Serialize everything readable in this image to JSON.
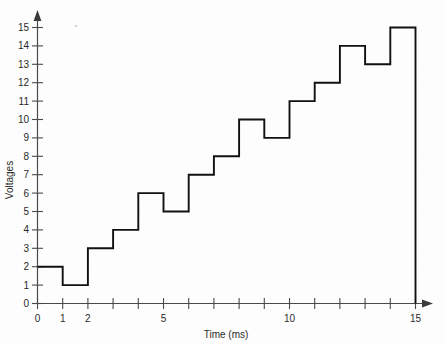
{
  "chart_data": {
    "type": "line",
    "subtype": "step-post",
    "title": "",
    "xlabel": "Time (ms)",
    "ylabel": "Voltages",
    "xlim": [
      0,
      15
    ],
    "ylim": [
      0,
      15
    ],
    "grid": false,
    "legend": null,
    "x_ticks": [
      0,
      1,
      2,
      3,
      4,
      5,
      6,
      7,
      8,
      9,
      10,
      11,
      12,
      13,
      14,
      15
    ],
    "x_tick_labels": [
      "0",
      "1",
      "2",
      "",
      "",
      "5",
      "",
      "",
      "",
      "",
      "10",
      "",
      "",
      "",
      "",
      "15"
    ],
    "y_ticks": [
      0,
      1,
      2,
      3,
      4,
      5,
      6,
      7,
      8,
      9,
      10,
      11,
      12,
      13,
      14,
      15
    ],
    "y_tick_labels": [
      "0",
      "1",
      "2",
      "3",
      "4",
      "5",
      "6",
      "7",
      "8",
      "9",
      "10",
      "11",
      "12",
      "13",
      "14",
      "15"
    ],
    "categories": [
      "0-1",
      "1-2",
      "2-3",
      "3-4",
      "4-5",
      "5-6",
      "6-7",
      "7-8",
      "8-9",
      "9-10",
      "10-11",
      "11-12",
      "12-13",
      "13-14",
      "14-15"
    ],
    "x": [
      0,
      1,
      2,
      3,
      4,
      5,
      6,
      7,
      8,
      9,
      10,
      11,
      12,
      13,
      14,
      15
    ],
    "values": [
      2,
      1,
      3,
      4,
      6,
      5,
      7,
      8,
      10,
      9,
      11,
      12,
      14,
      13,
      15
    ],
    "series": [
      {
        "name": "Voltages",
        "values": [
          2,
          1,
          3,
          4,
          6,
          5,
          7,
          8,
          10,
          9,
          11,
          12,
          14,
          13,
          15
        ],
        "color": "#111111"
      }
    ],
    "colors": {
      "line": "#111111",
      "axis": "#4a4a4a",
      "text": "#2a2a2a",
      "background": "#fdfdfd"
    }
  }
}
